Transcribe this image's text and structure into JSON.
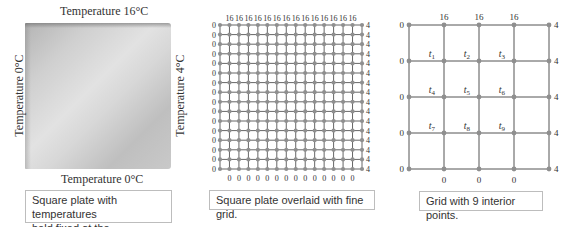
{
  "panel1": {
    "top_label": "Temperature 16°C",
    "bottom_label": "Temperature 0°C",
    "left_label": "Temperature 0°C",
    "right_label": "Temperature 4°C",
    "caption_line1": "Square plate with temperatures",
    "caption_line2": "held fixed at the boundaries.",
    "colors": {
      "light": "#e2e2e2",
      "mid": "#bfbfbf",
      "edge": "#8a8a8a"
    }
  },
  "panel2": {
    "caption": "Square plate overlaid with fine grid.",
    "grid": {
      "columns": 16,
      "rows": 16
    },
    "top_value": "16",
    "bottom_value": "0",
    "left_value": "0",
    "right_value": "4",
    "colors": {
      "line": "#666666",
      "node": "#8f8f8f"
    }
  },
  "panel3": {
    "caption": "Grid with 9 interior points.",
    "grid": {
      "columns": 5,
      "rows": 5
    },
    "top_values": [
      "16",
      "16",
      "16"
    ],
    "bottom_values": [
      "0",
      "0",
      "0"
    ],
    "left_values": [
      "0",
      "0",
      "0",
      "0",
      "0"
    ],
    "right_values": [
      "4",
      "4",
      "4",
      "4",
      "4"
    ],
    "interior_points": [
      {
        "label": "t",
        "sub": "1"
      },
      {
        "label": "t",
        "sub": "2"
      },
      {
        "label": "t",
        "sub": "3"
      },
      {
        "label": "t",
        "sub": "4"
      },
      {
        "label": "t",
        "sub": "5"
      },
      {
        "label": "t",
        "sub": "6"
      },
      {
        "label": "t",
        "sub": "7"
      },
      {
        "label": "t",
        "sub": "8"
      },
      {
        "label": "t",
        "sub": "9"
      }
    ]
  }
}
